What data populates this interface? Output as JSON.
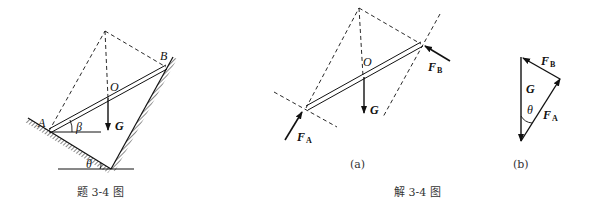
{
  "figure_left": {
    "caption": "题 3-4 图",
    "labels": {
      "A": "A",
      "B": "B",
      "O": "O",
      "G": "G",
      "beta": "β",
      "theta": "θ"
    }
  },
  "figure_a": {
    "caption": "(a)",
    "labels": {
      "O": "O",
      "G": "G",
      "FA": "F",
      "FA_sub": "A",
      "FB": "F",
      "FB_sub": "B"
    }
  },
  "figure_b": {
    "caption": "(b)",
    "labels": {
      "G": "G",
      "theta": "θ",
      "FA": "F",
      "FA_sub": "A",
      "FB": "F",
      "FB_sub": "B"
    }
  },
  "solution_caption": "解 3-4 图"
}
